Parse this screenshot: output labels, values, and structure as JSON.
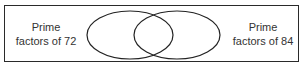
{
  "diagram": {
    "type": "venn",
    "sets": [
      {
        "line1": "Prime",
        "line2": "factors of 72"
      },
      {
        "line1": "Prime",
        "line2": "factors of 84"
      }
    ],
    "stroke_color": "#222222"
  }
}
